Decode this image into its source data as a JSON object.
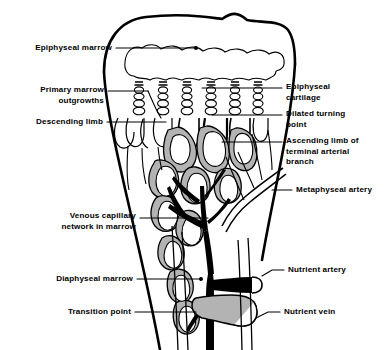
{
  "figure": {
    "type": "anatomical-diagram",
    "background_color": "#ffffff",
    "ink_color": "#000000",
    "trabecula_fill": "#b3b3b3",
    "artery_fill": "#000000",
    "vein_fill": "#b3b3b3"
  },
  "labels": {
    "epiphyseal_marrow": "Epiphyseal marrow",
    "primary_marrow_outgrowths": "Primary marrow\noutgrowths",
    "descending_limb": "Descending limb",
    "venous_capillary_network": "Venous capillary\nnetwork in marrow",
    "diaphyseal_marrow": "Diaphyseal marrow",
    "transition_point": "Transition point",
    "epiphyseal_cartilage": "Epiphyseal\ncartilage",
    "dilated_turning_point": "Dilated turning\npoint",
    "ascending_limb": "Ascending limb of\nterminal arterial\nbranch",
    "metaphyseal_artery": "Metaphyseal artery",
    "nutrient_artery": "Nutrient artery",
    "nutrient_vein": "Nutrient vein"
  }
}
